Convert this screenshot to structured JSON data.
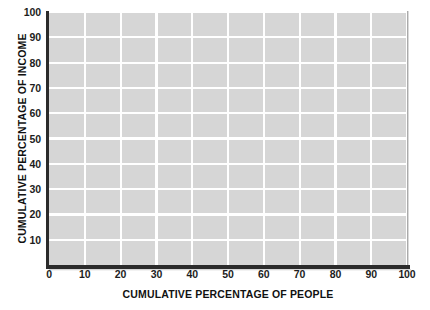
{
  "chart_data": {
    "type": "line",
    "title": "",
    "subtitle": "",
    "xlabel": "CUMULATIVE PERCENTAGE OF PEOPLE",
    "ylabel": "CUMULATIVE PERCENTAGE OF INCOME",
    "xlim": [
      0,
      100
    ],
    "ylim": [
      0,
      100
    ],
    "x_ticks": [
      0,
      10,
      20,
      30,
      40,
      50,
      60,
      70,
      80,
      90,
      100
    ],
    "x_tick_labels": [
      "0",
      "10",
      "20",
      "30",
      "40",
      "50",
      "60",
      "70",
      "80",
      "90",
      "100"
    ],
    "y_ticks": [
      10,
      20,
      30,
      40,
      50,
      60,
      70,
      80,
      90,
      100
    ],
    "y_tick_labels": [
      "10",
      "20",
      "30",
      "40",
      "50",
      "60",
      "70",
      "80",
      "90",
      "100"
    ],
    "grid": true,
    "grid_color": "#ffffff",
    "plot_background": "#d6d6d6",
    "figure_background": "#ffffff",
    "axis_color": "#2b2b2b",
    "legend": null,
    "legend_position": "none",
    "annotations": [],
    "series": [],
    "note": "Blank Lorenz-curve grid template: axes and gridlines only, no data plotted."
  },
  "axes": {
    "x": {
      "title": "CUMULATIVE PERCENTAGE OF PEOPLE",
      "ticks": [
        "0",
        "10",
        "20",
        "30",
        "40",
        "50",
        "60",
        "70",
        "80",
        "90",
        "100"
      ]
    },
    "y": {
      "title": "CUMULATIVE PERCENTAGE OF INCOME",
      "ticks": [
        "10",
        "20",
        "30",
        "40",
        "50",
        "60",
        "70",
        "80",
        "90",
        "100"
      ]
    }
  }
}
